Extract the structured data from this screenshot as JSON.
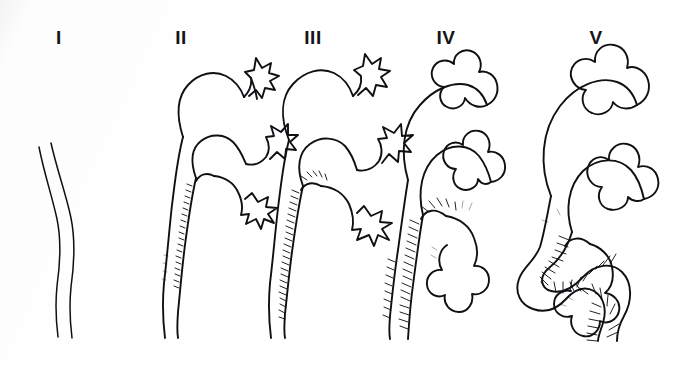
{
  "figure": {
    "background_color": "#fdfdfd",
    "ink_color": "#101014",
    "width": 677,
    "height": 365,
    "style": "hand-drawn black ink line illustration on white paper"
  },
  "panels": [
    {
      "id": "grade-1",
      "label": "I",
      "label_x": 59,
      "label_y": 28,
      "description": "Reflux into a non-dilated ureter only; thin wavy double-line ureter, no renal pelvis or calyces drawn",
      "has_kidney": false,
      "has_hatching": false,
      "ureter_width": "thin"
    },
    {
      "id": "grade-2",
      "label": "II",
      "label_x": 181,
      "label_y": 28,
      "description": "Reflux up to the renal pelvis and calyces without dilatation; sharp, star-shaped pointed calyces",
      "has_kidney": true,
      "has_hatching": true,
      "calyx_shape": "sharp-pointed",
      "ureter_width": "thin"
    },
    {
      "id": "grade-3",
      "label": "III",
      "label_x": 313,
      "label_y": 28,
      "description": "Mild to moderate dilatation of ureter, renal pelvis and calyces with minimal blunting of the fornices",
      "has_kidney": true,
      "has_hatching": true,
      "calyx_shape": "mildly-blunted",
      "ureter_width": "mild"
    },
    {
      "id": "grade-4",
      "label": "IV",
      "label_x": 446,
      "label_y": 28,
      "description": "Moderate dilatation with complete obliteration of sharp angle of fornices; rounded clubbed calyces, tortuous ureter",
      "has_kidney": true,
      "has_hatching": true,
      "calyx_shape": "rounded-clubbed",
      "ureter_width": "moderate"
    },
    {
      "id": "grade-5",
      "label": "V",
      "label_x": 596,
      "label_y": 28,
      "description": "Gross dilatation of ureter, pelvis and calyces; ureter markedly tortuous, papillary impressions lost",
      "has_kidney": true,
      "has_hatching": true,
      "calyx_shape": "ballooned",
      "ureter_width": "gross-tortuous"
    }
  ]
}
